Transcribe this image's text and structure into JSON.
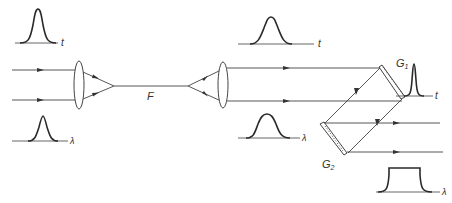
{
  "figure": {
    "labels": {
      "fiber": "F",
      "grating1": "G",
      "grating1_sub": "1",
      "grating2": "G",
      "grating2_sub": "2",
      "time_axis": "t",
      "wavelength_axis": "λ"
    },
    "stages": [
      {
        "name": "input",
        "temporal_profile": "narrow gaussian",
        "spectral_profile": "narrow gaussian"
      },
      {
        "name": "after-fiber",
        "temporal_profile": "broadened gaussian",
        "spectral_profile": "broadened gaussian"
      },
      {
        "name": "after-grating-pair",
        "temporal_profile": "compressed narrow pulse",
        "spectral_profile": "flat-top broadened spectrum"
      }
    ],
    "colors": {
      "line": "#444444",
      "curve": "#2a2a2a",
      "background": "#ffffff"
    }
  }
}
